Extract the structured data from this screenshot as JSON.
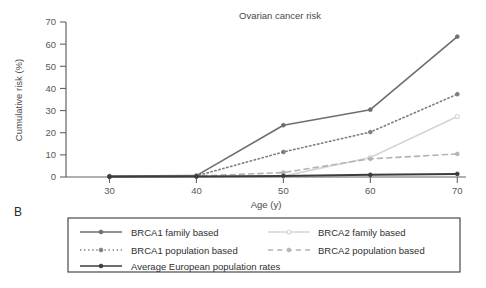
{
  "panel": {
    "label": "B"
  },
  "chart_data": {
    "type": "line",
    "title": "Ovarian cancer risk",
    "xlabel": "Age (y)",
    "ylabel": "Cumulative risk (%)",
    "x": [
      30,
      40,
      50,
      60,
      70
    ],
    "xticks": [
      "30",
      "40",
      "50",
      "60",
      "70"
    ],
    "yticks": [
      "0",
      "10",
      "20",
      "30",
      "40",
      "50",
      "60",
      "70"
    ],
    "xlim": [
      25,
      71
    ],
    "ylim": [
      0,
      70
    ],
    "grid": false,
    "legend_position": "below-plot",
    "series": [
      {
        "name": "BRCA1 family based",
        "values": [
          0.4,
          0.6,
          23.4,
          30.4,
          63.4
        ],
        "color": "#6e6e6e",
        "style": "solid",
        "marker": "filled-circle"
      },
      {
        "name": "BRCA1 population based",
        "values": [
          0.3,
          0.5,
          11.3,
          20.3,
          37.4
        ],
        "color": "#7d7d7d",
        "style": "dotted",
        "marker": "filled-circle"
      },
      {
        "name": "BRCA2 family based",
        "values": [
          0.2,
          0.3,
          0.4,
          8.8,
          27.3
        ],
        "color": "#d5d5d5",
        "style": "solid",
        "marker": "open-circle"
      },
      {
        "name": "BRCA2 population based",
        "values": [
          0.2,
          0.4,
          2.0,
          8.2,
          10.4
        ],
        "color": "#b4b4b4",
        "style": "dashed",
        "marker": "filled-circle"
      },
      {
        "name": "Average European population rates",
        "values": [
          0.1,
          0.2,
          0.5,
          1.0,
          1.4
        ],
        "color": "#3c3c3c",
        "style": "solid",
        "marker": "filled-circle"
      }
    ]
  },
  "legend": {
    "column_left": [
      "BRCA1 family based",
      "BRCA1 population based",
      "Average European population rates"
    ],
    "column_right": [
      "BRCA2 family based",
      "BRCA2 population based"
    ]
  }
}
